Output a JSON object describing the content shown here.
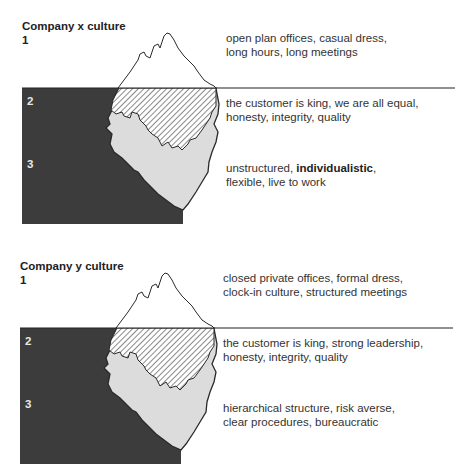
{
  "colors": {
    "water": "#3c3c3c",
    "iceberg_underwater": "#dcdcdc",
    "hatch_line": "#3a3a3a",
    "outline": "#2a2a2a",
    "text": "#333333"
  },
  "diagrams": [
    {
      "title": "Company x culture",
      "levels": [
        {
          "number": "1",
          "zone": "above water",
          "text_lines": [
            "open plan offices, casual dress,",
            "long hours, long meetings"
          ]
        },
        {
          "number": "2",
          "zone": "waterline (hatched)",
          "text_lines": [
            "the customer is king, we are all equal,",
            "honesty, integrity, quality"
          ]
        },
        {
          "number": "3",
          "zone": "deep underwater",
          "text_parts": [
            "unstructured, ",
            "individualistic",
            ","
          ],
          "text_line2": "flexible, live to work"
        }
      ]
    },
    {
      "title": "Company y culture",
      "levels": [
        {
          "number": "1",
          "zone": "above water",
          "text_lines": [
            "closed private offices, formal dress,",
            "clock-in culture, structured meetings"
          ]
        },
        {
          "number": "2",
          "zone": "waterline (hatched)",
          "text_lines": [
            "the customer is king, strong leadership,",
            "honesty, integrity, quality"
          ]
        },
        {
          "number": "3",
          "zone": "deep underwater",
          "text_lines": [
            "hierarchical structure, risk averse,",
            "clear procedures, bureaucratic"
          ]
        }
      ]
    }
  ]
}
